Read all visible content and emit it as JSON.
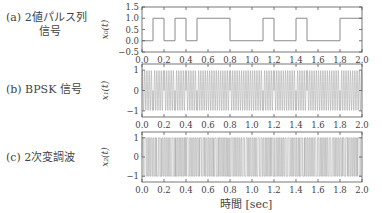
{
  "panels": [
    {
      "label": "(a) 2値パルス列",
      "label2": "信号",
      "ylabel": "x₀(t)"
    },
    {
      "label": "(b) BPSK 信号",
      "label2": "",
      "ylabel": "x₁(t)"
    },
    {
      "label": "(c) 2次変調波",
      "label2": "",
      "ylabel": "x₂(t)"
    }
  ],
  "xlabel": "時間 [sec]",
  "chart_data": [
    {
      "type": "line",
      "title": "(a) 2値パルス列信号",
      "ylabel": "x0(t)",
      "xlabel": "時間 [sec]",
      "xlim": [
        0.0,
        2.0
      ],
      "ylim": [
        -0.5,
        1.5
      ],
      "xticks": [
        "0.0",
        "0.2",
        "0.4",
        "0.6",
        "0.8",
        "1.0",
        "1.2",
        "1.4",
        "1.6",
        "1.8",
        "2.0"
      ],
      "yticks": [
        "−0.5",
        "0.0",
        "0.5",
        "1.0",
        "1.5"
      ],
      "step_x": [
        0.0,
        0.1,
        0.2,
        0.3,
        0.4,
        0.5,
        0.8,
        1.1,
        1.2,
        1.4,
        1.5,
        1.8,
        2.0
      ],
      "step_y": [
        0,
        1,
        0,
        1,
        0,
        1,
        0,
        1,
        0,
        1,
        0,
        1,
        1
      ],
      "bits_per_0.1s": [
        0,
        1,
        0,
        1,
        0,
        1,
        1,
        1,
        0,
        0,
        0,
        1,
        0,
        0,
        1,
        0,
        0,
        0,
        1,
        1
      ]
    },
    {
      "type": "line",
      "title": "(b) BPSK 信号",
      "ylabel": "x1(t)",
      "xlim": [
        0.0,
        2.0
      ],
      "ylim": [
        -1.3,
        1.3
      ],
      "xticks": [
        "0.0",
        "0.2",
        "0.4",
        "0.6",
        "0.8",
        "1.0",
        "1.2",
        "1.4",
        "1.6",
        "1.8",
        "2.0"
      ],
      "yticks": [
        "−1",
        "0",
        "1"
      ],
      "description": "constant-amplitude sinusoidal carrier with phase flips at bit boundaries"
    },
    {
      "type": "line",
      "title": "(c) 2次変調波",
      "ylabel": "x2(t)",
      "xlim": [
        0.0,
        2.0
      ],
      "ylim": [
        -1.3,
        1.3
      ],
      "xticks": [
        "0.0",
        "0.2",
        "0.4",
        "0.6",
        "0.8",
        "1.0",
        "1.2",
        "1.4",
        "1.6",
        "1.8",
        "2.0"
      ],
      "yticks": [
        "−1",
        "0",
        "1"
      ],
      "description": "second-order modulated wave, square-like switching between −1 and 1"
    }
  ]
}
